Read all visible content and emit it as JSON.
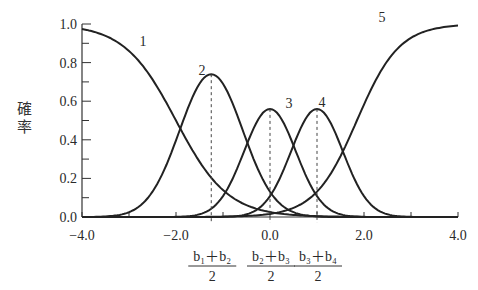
{
  "chart_data": {
    "type": "line",
    "title": "",
    "xlabel": "",
    "ylabel": "確率",
    "xlim": [
      -4.0,
      4.0
    ],
    "ylim": [
      0.0,
      1.0
    ],
    "x_ticks": [
      "−4.0",
      "−2.0",
      "0.0",
      "2.0",
      "4.0"
    ],
    "y_ticks": [
      "0.0",
      "0.2",
      "0.4",
      "0.6",
      "0.8",
      "1.0"
    ],
    "grid": false,
    "thresholds": [
      -2.5,
      0.0,
      0.5,
      2.5
    ],
    "midpoints": [
      {
        "x": -1.25,
        "label_num": "b₁＋b₂",
        "label_den": "2"
      },
      {
        "x": 0.0,
        "label_num": "b₂＋b₃",
        "label_den": "2"
      },
      {
        "x": 1.0,
        "label_num": "b₃＋b₄",
        "label_den": "2"
      }
    ],
    "series": [
      {
        "name": "1",
        "peak_x": -4.0,
        "peak_y": 1.0
      },
      {
        "name": "2",
        "peak_x": -1.25,
        "peak_y": 0.74
      },
      {
        "name": "3",
        "peak_x": 0.0,
        "peak_y": 0.56
      },
      {
        "name": "4",
        "peak_x": 1.0,
        "peak_y": 0.56
      },
      {
        "name": "5",
        "peak_x": 4.0,
        "peak_y": 1.0
      }
    ],
    "x": [
      -4.0,
      -3.0,
      -2.0,
      -1.25,
      0.0,
      1.0,
      2.0,
      3.0,
      4.0
    ],
    "series_values": {
      "1": [
        1.0,
        0.88,
        0.45,
        0.12,
        0.02,
        0.0,
        0.0,
        0.0,
        0.0
      ],
      "2": [
        0.0,
        0.12,
        0.52,
        0.74,
        0.3,
        0.06,
        0.01,
        0.0,
        0.0
      ],
      "3": [
        0.0,
        0.0,
        0.03,
        0.13,
        0.56,
        0.3,
        0.05,
        0.0,
        0.0
      ],
      "4": [
        0.0,
        0.0,
        0.0,
        0.02,
        0.3,
        0.56,
        0.18,
        0.03,
        0.0
      ],
      "5": [
        0.0,
        0.0,
        0.0,
        0.0,
        0.02,
        0.18,
        0.76,
        0.97,
        1.0
      ]
    }
  }
}
